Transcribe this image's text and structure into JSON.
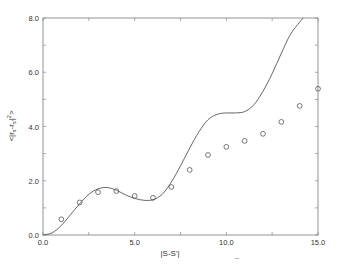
{
  "chart_data": {
    "type": "line",
    "title": "",
    "xlabel": "|S-S'|",
    "ylabel": "<|r_s - r_s'|^2>",
    "xlim": [
      0,
      15
    ],
    "ylim": [
      0,
      8
    ],
    "grid": false,
    "legend": null,
    "x_ticks": [
      "0.0",
      "5.0",
      "10.0",
      "15.0"
    ],
    "y_ticks": [
      "0.0",
      "2.0",
      "4.0",
      "6.0",
      "8.0"
    ],
    "series": [
      {
        "name": "curve",
        "style": "solid-line",
        "x": [
          0,
          0.5,
          1,
          1.5,
          2,
          2.5,
          3,
          3.5,
          4,
          4.5,
          5,
          5.5,
          6,
          6.5,
          7,
          7.5,
          8,
          8.5,
          9,
          9.5,
          10,
          10.5,
          11,
          11.5,
          12,
          12.5,
          13,
          13.5,
          14,
          14.2
        ],
        "values": [
          0.0,
          0.08,
          0.35,
          0.75,
          1.15,
          1.5,
          1.7,
          1.75,
          1.65,
          1.48,
          1.35,
          1.28,
          1.3,
          1.5,
          1.95,
          2.55,
          3.2,
          3.8,
          4.25,
          4.45,
          4.5,
          4.5,
          4.55,
          4.8,
          5.3,
          5.95,
          6.7,
          7.4,
          7.85,
          8.0
        ]
      },
      {
        "name": "points",
        "style": "open-circle",
        "x": [
          1,
          2,
          3,
          4,
          5,
          6,
          7,
          8,
          9,
          10,
          11,
          12,
          13,
          14,
          15
        ],
        "values": [
          0.58,
          1.2,
          1.58,
          1.62,
          1.44,
          1.37,
          1.77,
          2.4,
          2.95,
          3.25,
          3.47,
          3.73,
          4.17,
          4.76,
          5.39
        ]
      }
    ],
    "stray_mark_below_axis": "¯"
  },
  "colors": {
    "axis": "#888888",
    "line": "#555555",
    "marker": "#555555",
    "text": "#333333"
  }
}
